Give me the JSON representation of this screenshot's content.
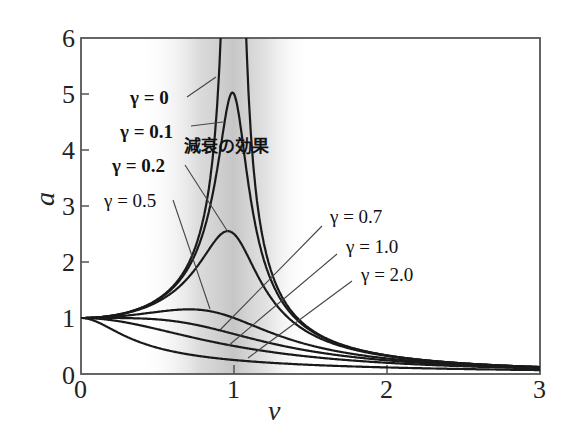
{
  "chart_data": {
    "type": "line",
    "title": "",
    "xlabel": "ν",
    "ylabel": "a",
    "xlim": [
      0,
      3
    ],
    "ylim": [
      0,
      6
    ],
    "x_ticks": [
      "0",
      "1",
      "2",
      "3"
    ],
    "y_ticks": [
      "0",
      "1",
      "2",
      "3",
      "4",
      "5",
      "6"
    ],
    "grid": false,
    "legend_position": "inline labels with leader lines",
    "formula": "a = 1 / sqrt((1 - ν²)² + (2γν)²)",
    "shaded_band": {
      "x_from": 0.45,
      "x_to": 1.45,
      "peak_x": 1.0
    },
    "annotation": "減衰の効果",
    "series": [
      {
        "name": "γ = 0",
        "gamma": 0.0,
        "peak": "∞ at ν = 1",
        "points": [
          [
            0,
            1
          ],
          [
            0.5,
            1.33
          ],
          [
            0.8,
            2.78
          ],
          [
            0.9,
            5.26
          ],
          [
            1.1,
            4.76
          ],
          [
            1.2,
            2.27
          ],
          [
            1.5,
            0.8
          ],
          [
            2,
            0.33
          ],
          [
            3,
            0.125
          ]
        ]
      },
      {
        "name": "γ = 0.1",
        "gamma": 0.1,
        "peak": 5.03,
        "points": [
          [
            0,
            1
          ],
          [
            0.5,
            1.32
          ],
          [
            0.8,
            2.55
          ],
          [
            0.99,
            5.03
          ],
          [
            1.2,
            2.11
          ],
          [
            1.5,
            0.79
          ],
          [
            2,
            0.33
          ],
          [
            3,
            0.125
          ]
        ]
      },
      {
        "name": "γ = 0.2",
        "gamma": 0.2,
        "peak": 2.55,
        "points": [
          [
            0,
            1
          ],
          [
            0.5,
            1.28
          ],
          [
            0.8,
            2.04
          ],
          [
            0.96,
            2.55
          ],
          [
            1.2,
            1.67
          ],
          [
            1.5,
            0.74
          ],
          [
            2,
            0.32
          ],
          [
            3,
            0.124
          ]
        ]
      },
      {
        "name": "γ = 0.5",
        "gamma": 0.5,
        "peak": 1.15,
        "points": [
          [
            0,
            1
          ],
          [
            0.5,
            1.11
          ],
          [
            0.71,
            1.15
          ],
          [
            1,
            1.0
          ],
          [
            1.5,
            0.55
          ],
          [
            2,
            0.28
          ],
          [
            3,
            0.12
          ]
        ]
      },
      {
        "name": "γ = 0.7",
        "gamma": 0.7,
        "peak": 1.0,
        "points": [
          [
            0,
            1
          ],
          [
            0.5,
            0.95
          ],
          [
            1,
            0.71
          ],
          [
            1.5,
            0.42
          ],
          [
            2,
            0.24
          ],
          [
            3,
            0.11
          ]
        ]
      },
      {
        "name": "γ = 1.0",
        "gamma": 1.0,
        "peak": 1.0,
        "points": [
          [
            0,
            1
          ],
          [
            0.5,
            0.8
          ],
          [
            1,
            0.5
          ],
          [
            1.5,
            0.31
          ],
          [
            2,
            0.2
          ],
          [
            3,
            0.1
          ]
        ]
      },
      {
        "name": "γ = 2.0",
        "gamma": 2.0,
        "peak": 1.0,
        "points": [
          [
            0,
            1
          ],
          [
            0.5,
            0.49
          ],
          [
            1,
            0.25
          ],
          [
            1.5,
            0.16
          ],
          [
            2,
            0.11
          ],
          [
            3,
            0.07
          ]
        ]
      }
    ]
  },
  "labels": {
    "gamma_0": "γ = 0",
    "gamma_01": "γ = 0.1",
    "gamma_02": "γ = 0.2",
    "gamma_05": "γ = 0.5",
    "gamma_07": "γ = 0.7",
    "gamma_10": "γ = 1.0",
    "gamma_20": "γ = 2.0",
    "damping_effect": "減衰の効果"
  },
  "axes": {
    "x_label": "ν",
    "y_label": "a",
    "x_ticks": [
      "0",
      "1",
      "2",
      "3"
    ],
    "y_ticks": [
      "0",
      "1",
      "2",
      "3",
      "4",
      "5",
      "6"
    ]
  },
  "colors": {
    "curve": "#1a1a1a",
    "leader": "#444444",
    "axis": "#555555",
    "band": "#bdbdbd"
  }
}
